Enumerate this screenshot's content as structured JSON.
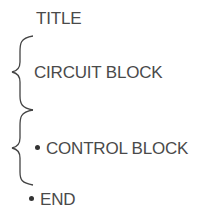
{
  "diagram": {
    "items": [
      {
        "label": "TITLE",
        "bullet": false
      },
      {
        "label": "CIRCUIT BLOCK",
        "bullet": false,
        "braced": true
      },
      {
        "label": "CONTROL BLOCK",
        "bullet": true,
        "braced": true
      },
      {
        "label": "END",
        "bullet": true
      }
    ],
    "colors": {
      "text": "#4a4a4a",
      "brace": "#444444"
    }
  }
}
